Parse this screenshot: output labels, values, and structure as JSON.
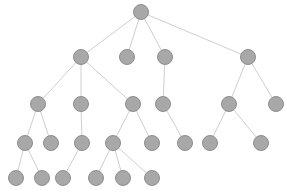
{
  "diagram": {
    "type": "tree",
    "style": {
      "node_fill": "#a8a8a8",
      "node_stroke": "#8e8e8e",
      "edge_color": "#cfcfcf",
      "node_radius": 7.5,
      "background": "#ffffff"
    },
    "nodes": [
      {
        "id": "n0",
        "x": 141,
        "y": 12,
        "level": 0
      },
      {
        "id": "n1",
        "x": 81,
        "y": 57,
        "level": 1
      },
      {
        "id": "n2",
        "x": 127,
        "y": 57,
        "level": 1
      },
      {
        "id": "n3",
        "x": 165,
        "y": 57,
        "level": 1
      },
      {
        "id": "n4",
        "x": 248,
        "y": 57,
        "level": 1
      },
      {
        "id": "n5",
        "x": 38,
        "y": 104,
        "level": 2
      },
      {
        "id": "n6",
        "x": 81,
        "y": 104,
        "level": 2
      },
      {
        "id": "n7",
        "x": 133,
        "y": 104,
        "level": 2
      },
      {
        "id": "n8",
        "x": 163,
        "y": 104,
        "level": 2
      },
      {
        "id": "n9",
        "x": 229,
        "y": 104,
        "level": 2
      },
      {
        "id": "n10",
        "x": 276,
        "y": 104,
        "level": 2
      },
      {
        "id": "n11",
        "x": 25,
        "y": 143,
        "level": 3
      },
      {
        "id": "n12",
        "x": 51,
        "y": 143,
        "level": 3
      },
      {
        "id": "n13",
        "x": 82,
        "y": 143,
        "level": 3
      },
      {
        "id": "n14",
        "x": 113,
        "y": 143,
        "level": 3
      },
      {
        "id": "n15",
        "x": 152,
        "y": 143,
        "level": 3
      },
      {
        "id": "n16",
        "x": 185,
        "y": 143,
        "level": 3
      },
      {
        "id": "n17",
        "x": 210,
        "y": 143,
        "level": 3
      },
      {
        "id": "n18",
        "x": 261,
        "y": 143,
        "level": 3
      },
      {
        "id": "n19",
        "x": 16,
        "y": 178,
        "level": 4
      },
      {
        "id": "n20",
        "x": 42,
        "y": 178,
        "level": 4
      },
      {
        "id": "n21",
        "x": 63,
        "y": 178,
        "level": 4
      },
      {
        "id": "n22",
        "x": 96,
        "y": 178,
        "level": 4
      },
      {
        "id": "n23",
        "x": 123,
        "y": 178,
        "level": 4
      },
      {
        "id": "n24",
        "x": 152,
        "y": 178,
        "level": 4
      }
    ],
    "edges": [
      [
        "n0",
        "n1"
      ],
      [
        "n0",
        "n2"
      ],
      [
        "n0",
        "n3"
      ],
      [
        "n0",
        "n4"
      ],
      [
        "n1",
        "n5"
      ],
      [
        "n1",
        "n6"
      ],
      [
        "n1",
        "n7"
      ],
      [
        "n3",
        "n8"
      ],
      [
        "n4",
        "n9"
      ],
      [
        "n4",
        "n10"
      ],
      [
        "n5",
        "n11"
      ],
      [
        "n5",
        "n12"
      ],
      [
        "n6",
        "n13"
      ],
      [
        "n7",
        "n14"
      ],
      [
        "n7",
        "n15"
      ],
      [
        "n8",
        "n16"
      ],
      [
        "n9",
        "n17"
      ],
      [
        "n9",
        "n18"
      ],
      [
        "n11",
        "n19"
      ],
      [
        "n11",
        "n20"
      ],
      [
        "n13",
        "n21"
      ],
      [
        "n14",
        "n22"
      ],
      [
        "n14",
        "n23"
      ],
      [
        "n14",
        "n24"
      ]
    ]
  }
}
